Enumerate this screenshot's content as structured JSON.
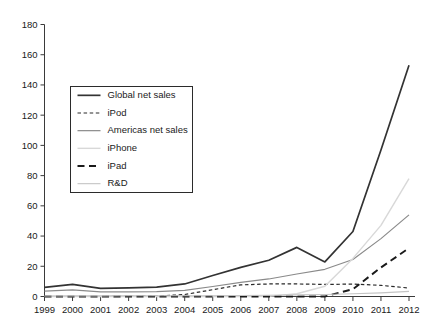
{
  "chart_data": {
    "type": "line",
    "title": "",
    "xlabel": "",
    "ylabel": "",
    "x": [
      1999,
      2000,
      2001,
      2002,
      2003,
      2004,
      2005,
      2006,
      2007,
      2008,
      2009,
      2010,
      2011,
      2012
    ],
    "categories": [
      "1999",
      "2000",
      "2001",
      "2002",
      "2003",
      "2004",
      "2005",
      "2006",
      "2007",
      "2008",
      "2009",
      "2010",
      "2011",
      "2012"
    ],
    "xlim": [
      1999,
      2012
    ],
    "ylim": [
      0,
      180
    ],
    "yticks": [
      0,
      20,
      40,
      60,
      80,
      100,
      120,
      140,
      160,
      180
    ],
    "ytick_labels": [
      "0",
      "20",
      "40",
      "60",
      "80",
      "100",
      "120",
      "140",
      "160",
      "180"
    ],
    "grid": false,
    "legend_position": "upper-left-inside",
    "series": [
      {
        "name": "Global net sales",
        "style": "solid",
        "color": "#333333",
        "width": 1.7,
        "values": [
          6.1,
          8.0,
          5.4,
          5.7,
          6.2,
          8.3,
          13.9,
          19.3,
          24.0,
          32.5,
          22.9,
          43.0,
          97.0,
          153.0
        ]
      },
      {
        "name": "iPod",
        "style": "dashed",
        "color": "#2a2a2a",
        "width": 1.2,
        "values": [
          0.0,
          0.0,
          0.0,
          0.1,
          0.3,
          1.3,
          4.5,
          7.7,
          8.3,
          8.3,
          8.0,
          8.2,
          7.4,
          5.6
        ]
      },
      {
        "name": "Americas net sales",
        "style": "solid",
        "color": "#8a8a8a",
        "width": 1.2,
        "values": [
          3.5,
          4.4,
          3.1,
          3.1,
          3.2,
          4.0,
          6.6,
          9.3,
          11.6,
          14.9,
          18.0,
          24.5,
          38.3,
          54.0
        ]
      },
      {
        "name": "iPhone",
        "style": "solid",
        "color": "#d8d8d8",
        "width": 1.4,
        "values": [
          0.0,
          0.0,
          0.0,
          0.0,
          0.0,
          0.0,
          0.0,
          0.0,
          0.1,
          1.8,
          6.8,
          25.2,
          47.1,
          78.0
        ]
      },
      {
        "name": "iPad",
        "style": "longdash",
        "color": "#1a1a1a",
        "width": 1.9,
        "values": [
          0.0,
          0.0,
          0.0,
          0.0,
          0.0,
          0.0,
          0.0,
          0.0,
          0.0,
          0.0,
          0.0,
          4.9,
          19.2,
          32.0
        ]
      },
      {
        "name": "R&D",
        "style": "solid",
        "color": "#c4c4c4",
        "width": 1.1,
        "values": [
          0.3,
          0.4,
          0.4,
          0.45,
          0.47,
          0.49,
          0.53,
          0.71,
          0.78,
          1.1,
          1.3,
          1.8,
          2.4,
          3.4
        ]
      }
    ]
  },
  "legend": {
    "entries": [
      {
        "label": "Global net sales"
      },
      {
        "label": "iPod"
      },
      {
        "label": "Americas net sales"
      },
      {
        "label": "iPhone"
      },
      {
        "label": "iPad"
      },
      {
        "label": "R&D"
      }
    ]
  }
}
